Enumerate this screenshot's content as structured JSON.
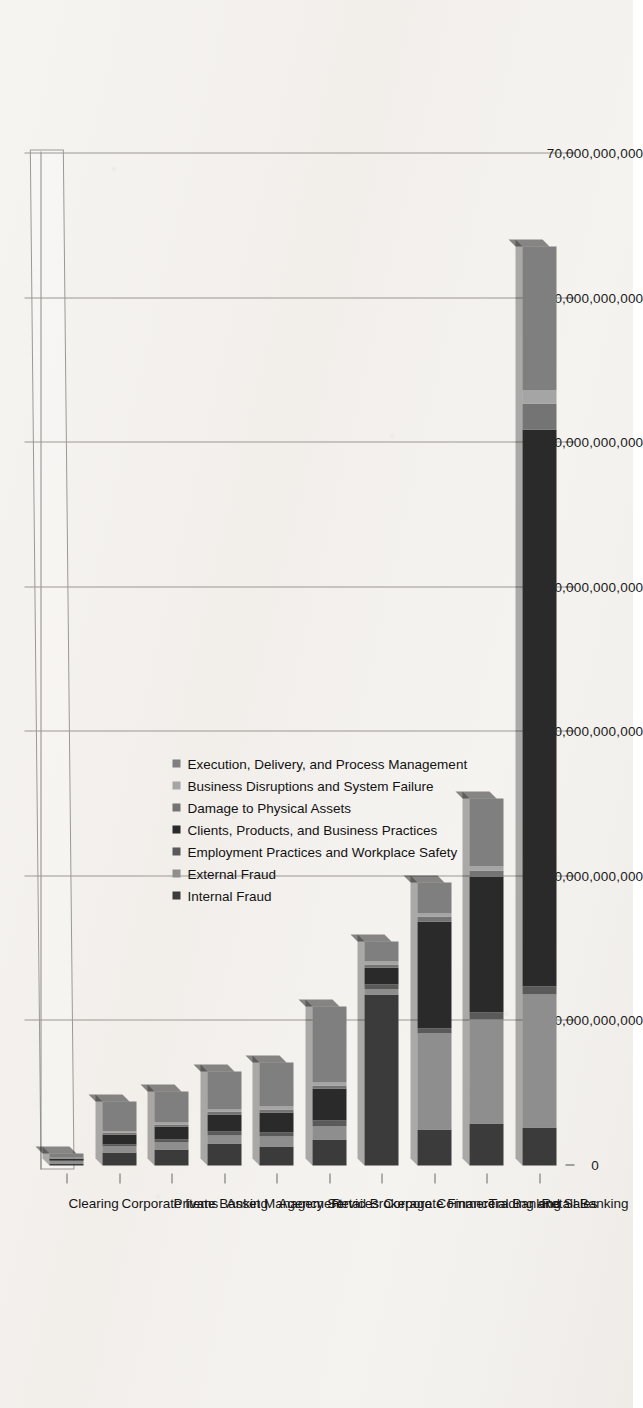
{
  "chart_data": {
    "type": "bar",
    "subtype": "stacked-bar-3d-horizontalpage",
    "title": "",
    "xlabel": "",
    "ylabel": "",
    "grid": true,
    "legend_position": "center",
    "orientation": "page-rotated-90",
    "axis": {
      "ticks": [
        "0",
        "10,000,000,000",
        "20,000,000,000",
        "30,000,000,000",
        "40,000,000,000",
        "50,000,000,000",
        "60,000,000,000",
        "70,000,000,000"
      ],
      "min": 0,
      "max": 70000000000,
      "step": 10000000000
    },
    "categories": [
      "Clearing",
      "Corporate Items",
      "Private Banking",
      "Asset Management",
      "Agency Services",
      "Retail Brokerage",
      "Corporate Finance",
      "Commercial Banking",
      "Trading and Sales",
      "Retail Banking"
    ],
    "series": [
      {
        "name": "Internal Fraud",
        "color": "#3b3b3b",
        "values": [
          120000000,
          900000000,
          1100000000,
          1500000000,
          1300000000,
          1800000000,
          11800000000,
          2500000000,
          2900000000,
          2600000000
        ]
      },
      {
        "name": "External Fraud",
        "color": "#8e8e8e",
        "values": [
          200000000,
          400000000,
          500000000,
          600000000,
          700000000,
          900000000,
          400000000,
          6600000000,
          7200000000,
          9200000000
        ]
      },
      {
        "name": "Employment Practices and Workplace Safety",
        "color": "#5a5a5a",
        "values": [
          60000000,
          150000000,
          200000000,
          250000000,
          300000000,
          400000000,
          300000000,
          400000000,
          500000000,
          600000000
        ]
      },
      {
        "name": "Clients, Products, and Business Practices",
        "color": "#2a2a2a",
        "values": [
          80000000,
          700000000,
          900000000,
          1200000000,
          1400000000,
          2200000000,
          1200000000,
          7400000000,
          9400000000,
          38500000000
        ]
      },
      {
        "name": "Damage to Physical Assets",
        "color": "#747474",
        "values": [
          40000000,
          120000000,
          150000000,
          180000000,
          200000000,
          250000000,
          200000000,
          300000000,
          400000000,
          1800000000
        ]
      },
      {
        "name": "Business Disruptions and System Failure",
        "color": "#a5a5a5",
        "values": [
          30000000,
          100000000,
          120000000,
          150000000,
          160000000,
          200000000,
          180000000,
          250000000,
          300000000,
          900000000
        ]
      },
      {
        "name": "Execution, Delivery, and Process Management",
        "color": "#7f7f7f",
        "values": [
          270000000,
          2030000000,
          2130000000,
          2620000000,
          3040000000,
          5250000000,
          1420000000,
          2150000000,
          4700000000,
          10000000000
        ]
      }
    ],
    "totals": [
      800000000,
      4400000000,
      5100000000,
      6500000000,
      7100000000,
      11000000000,
      15500000000,
      19600000000,
      25400000000,
      63600000000
    ]
  },
  "legend": {
    "items": [
      {
        "label": "Internal Fraud",
        "color": "#3b3b3b"
      },
      {
        "label": "External Fraud",
        "color": "#8e8e8e"
      },
      {
        "label": "Employment Practices and Workplace Safety",
        "color": "#5a5a5a"
      },
      {
        "label": "Clients, Products, and Business Practices",
        "color": "#2a2a2a"
      },
      {
        "label": "Damage to Physical Assets",
        "color": "#747474"
      },
      {
        "label": "Business Disruptions and System Failure",
        "color": "#a5a5a5"
      },
      {
        "label": "Execution, Delivery, and Process Management",
        "color": "#7f7f7f"
      }
    ]
  }
}
